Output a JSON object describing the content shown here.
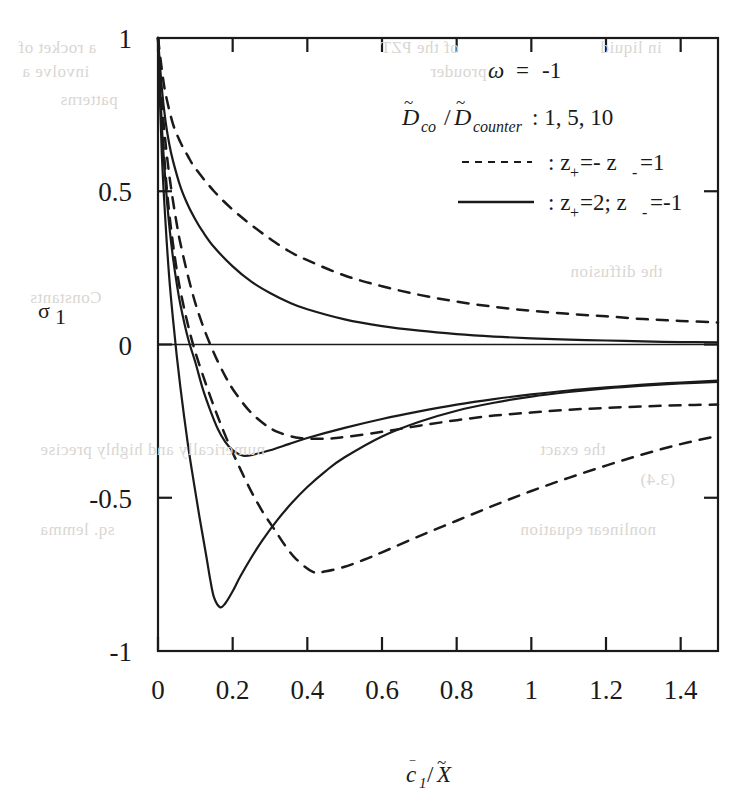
{
  "figure": {
    "background_color": "#ffffff",
    "ink_color": "#1a1a1a"
  },
  "axes": {
    "xlabel": "c̅1/X̃",
    "ylabel": "σ1",
    "x_ticks": [
      "0",
      "0.2",
      "0.4",
      "0.6",
      "0.8",
      "1",
      "1.2",
      "1.4"
    ],
    "y_ticks": [
      "1",
      "0.5",
      "0",
      "-0.5",
      "-1"
    ],
    "xlim": [
      0,
      1.5
    ],
    "ylim": [
      -1,
      1
    ]
  },
  "legend": {
    "omega_line": "ω = -1",
    "ratio_label_d": "D",
    "ratio_label_co": "co",
    "ratio_slash": "/",
    "ratio_label_d2": "D",
    "ratio_label_counter": "counter",
    "ratio_values": ": 1, 5, 10",
    "dashed_entry": ": z+ =- z- =1",
    "solid_entry": ": z+ =2; z- =-1",
    "dashed_z_base": ": z",
    "dashed_z_plus": "+",
    "dashed_z_mid": " =- z",
    "dashed_z_minus": "-",
    "dashed_z_tail": " =1",
    "solid_z_base": ": z",
    "solid_z_plus": "+",
    "solid_z_mid": " =2; z",
    "solid_z_minus": "-",
    "solid_z_tail": " =-1"
  },
  "bleed_through": [
    {
      "text": "a rocket of",
      "x": 18,
      "y": 38
    },
    {
      "text": "of the PZT",
      "x": 380,
      "y": 38
    },
    {
      "text": "in liquid",
      "x": 600,
      "y": 38
    },
    {
      "text": "involve a",
      "x": 22,
      "y": 62
    },
    {
      "text": "prouder",
      "x": 430,
      "y": 62
    },
    {
      "text": "patterns",
      "x": 60,
      "y": 90
    },
    {
      "text": "numerically and highly precise",
      "x": 40,
      "y": 440
    },
    {
      "text": "the exact",
      "x": 540,
      "y": 440
    },
    {
      "text": "(3.4)",
      "x": 640,
      "y": 470
    },
    {
      "text": "Constants",
      "x": 30,
      "y": 288
    },
    {
      "text": "the diffusion",
      "x": 570,
      "y": 262
    },
    {
      "text": "sq. lemma",
      "x": 40,
      "y": 520
    },
    {
      "text": "nonlinear equation",
      "x": 520,
      "y": 520
    }
  ],
  "chart_data": {
    "type": "line",
    "title": "",
    "xlabel": "c̅1/X̃",
    "ylabel": "σ1",
    "xlim": [
      0,
      1.5
    ],
    "ylim": [
      -1,
      1
    ],
    "grid": false,
    "legend_position": "top-right",
    "annotations": [
      "ω = -1",
      "D̃co/D̃counter : 1, 5, 10"
    ],
    "series": [
      {
        "name": "z+=-z-=1, Dco/Dcounter = 10",
        "style": "dashed",
        "points": [
          [
            0.0,
            1.0
          ],
          [
            0.01,
            0.9
          ],
          [
            0.02,
            0.82
          ],
          [
            0.04,
            0.72
          ],
          [
            0.06,
            0.66
          ],
          [
            0.08,
            0.615
          ],
          [
            0.1,
            0.575
          ],
          [
            0.15,
            0.5
          ],
          [
            0.2,
            0.44
          ],
          [
            0.25,
            0.39
          ],
          [
            0.3,
            0.345
          ],
          [
            0.35,
            0.305
          ],
          [
            0.4,
            0.275
          ],
          [
            0.5,
            0.225
          ],
          [
            0.6,
            0.19
          ],
          [
            0.7,
            0.162
          ],
          [
            0.8,
            0.14
          ],
          [
            0.9,
            0.123
          ],
          [
            1.0,
            0.11
          ],
          [
            1.1,
            0.1
          ],
          [
            1.2,
            0.092
          ],
          [
            1.3,
            0.083
          ],
          [
            1.4,
            0.077
          ],
          [
            1.5,
            0.072
          ]
        ]
      },
      {
        "name": "z+=2;z-=-1, Dco/Dcounter = 10",
        "style": "solid",
        "points": [
          [
            0.0,
            1.0
          ],
          [
            0.01,
            0.84
          ],
          [
            0.02,
            0.73
          ],
          [
            0.03,
            0.655
          ],
          [
            0.04,
            0.6
          ],
          [
            0.06,
            0.515
          ],
          [
            0.08,
            0.455
          ],
          [
            0.1,
            0.408
          ],
          [
            0.12,
            0.368
          ],
          [
            0.15,
            0.318
          ],
          [
            0.2,
            0.255
          ],
          [
            0.25,
            0.205
          ],
          [
            0.3,
            0.168
          ],
          [
            0.35,
            0.138
          ],
          [
            0.4,
            0.115
          ],
          [
            0.5,
            0.082
          ],
          [
            0.6,
            0.06
          ],
          [
            0.7,
            0.045
          ],
          [
            0.8,
            0.034
          ],
          [
            0.9,
            0.026
          ],
          [
            1.0,
            0.02
          ],
          [
            1.1,
            0.016
          ],
          [
            1.2,
            0.013
          ],
          [
            1.3,
            0.01
          ],
          [
            1.4,
            0.008
          ],
          [
            1.5,
            0.007
          ]
        ]
      },
      {
        "name": "z+=-z-=1, Dco/Dcounter = 5",
        "style": "dashed",
        "points": [
          [
            0.0,
            1.0
          ],
          [
            0.01,
            0.8
          ],
          [
            0.02,
            0.66
          ],
          [
            0.03,
            0.555
          ],
          [
            0.04,
            0.47
          ],
          [
            0.05,
            0.395
          ],
          [
            0.06,
            0.33
          ],
          [
            0.08,
            0.225
          ],
          [
            0.1,
            0.135
          ],
          [
            0.12,
            0.062
          ],
          [
            0.14,
            0.0
          ],
          [
            0.16,
            -0.055
          ],
          [
            0.18,
            -0.103
          ],
          [
            0.2,
            -0.145
          ],
          [
            0.24,
            -0.21
          ],
          [
            0.28,
            -0.255
          ],
          [
            0.32,
            -0.285
          ],
          [
            0.38,
            -0.305
          ],
          [
            0.45,
            -0.307
          ],
          [
            0.5,
            -0.302
          ],
          [
            0.6,
            -0.285
          ],
          [
            0.7,
            -0.265
          ],
          [
            0.8,
            -0.247
          ],
          [
            0.9,
            -0.232
          ],
          [
            1.0,
            -0.222
          ],
          [
            1.1,
            -0.213
          ],
          [
            1.2,
            -0.207
          ],
          [
            1.3,
            -0.202
          ],
          [
            1.4,
            -0.198
          ],
          [
            1.5,
            -0.196
          ]
        ]
      },
      {
        "name": "z+=2;z-=-1, Dco/Dcounter = 5",
        "style": "solid",
        "points": [
          [
            0.0,
            1.0
          ],
          [
            0.01,
            0.72
          ],
          [
            0.02,
            0.53
          ],
          [
            0.03,
            0.39
          ],
          [
            0.04,
            0.285
          ],
          [
            0.05,
            0.2
          ],
          [
            0.06,
            0.13
          ],
          [
            0.08,
            0.022
          ],
          [
            0.1,
            -0.058
          ],
          [
            0.12,
            -0.145
          ],
          [
            0.14,
            -0.215
          ],
          [
            0.16,
            -0.275
          ],
          [
            0.18,
            -0.318
          ],
          [
            0.2,
            -0.345
          ],
          [
            0.228,
            -0.363
          ],
          [
            0.26,
            -0.358
          ],
          [
            0.3,
            -0.345
          ],
          [
            0.35,
            -0.325
          ],
          [
            0.4,
            -0.305
          ],
          [
            0.5,
            -0.272
          ],
          [
            0.6,
            -0.243
          ],
          [
            0.7,
            -0.218
          ],
          [
            0.8,
            -0.196
          ],
          [
            0.9,
            -0.178
          ],
          [
            1.0,
            -0.163
          ],
          [
            1.1,
            -0.15
          ],
          [
            1.2,
            -0.14
          ],
          [
            1.3,
            -0.131
          ],
          [
            1.4,
            -0.124
          ],
          [
            1.5,
            -0.118
          ]
        ]
      },
      {
        "name": "z+=-z-=1, Dco/Dcounter = 1",
        "style": "dashed",
        "points": [
          [
            0.0,
            1.0
          ],
          [
            0.01,
            0.74
          ],
          [
            0.02,
            0.56
          ],
          [
            0.03,
            0.43
          ],
          [
            0.04,
            0.33
          ],
          [
            0.05,
            0.245
          ],
          [
            0.06,
            0.175
          ],
          [
            0.08,
            0.065
          ],
          [
            0.1,
            -0.025
          ],
          [
            0.13,
            -0.135
          ],
          [
            0.16,
            -0.235
          ],
          [
            0.19,
            -0.325
          ],
          [
            0.22,
            -0.405
          ],
          [
            0.25,
            -0.48
          ],
          [
            0.28,
            -0.545
          ],
          [
            0.31,
            -0.6
          ],
          [
            0.34,
            -0.655
          ],
          [
            0.37,
            -0.7
          ],
          [
            0.415,
            -0.742
          ],
          [
            0.45,
            -0.74
          ],
          [
            0.5,
            -0.725
          ],
          [
            0.55,
            -0.703
          ],
          [
            0.6,
            -0.678
          ],
          [
            0.7,
            -0.625
          ],
          [
            0.8,
            -0.575
          ],
          [
            0.9,
            -0.525
          ],
          [
            1.0,
            -0.478
          ],
          [
            1.1,
            -0.435
          ],
          [
            1.2,
            -0.395
          ],
          [
            1.3,
            -0.358
          ],
          [
            1.4,
            -0.325
          ],
          [
            1.5,
            -0.298
          ]
        ]
      },
      {
        "name": "z+=2;z-=-1, Dco/Dcounter = 1",
        "style": "solid",
        "points": [
          [
            0.0,
            1.0
          ],
          [
            0.01,
            0.63
          ],
          [
            0.02,
            0.4
          ],
          [
            0.03,
            0.22
          ],
          [
            0.04,
            0.085
          ],
          [
            0.05,
            -0.035
          ],
          [
            0.06,
            -0.14
          ],
          [
            0.07,
            -0.235
          ],
          [
            0.08,
            -0.325
          ],
          [
            0.09,
            -0.405
          ],
          [
            0.1,
            -0.48
          ],
          [
            0.11,
            -0.555
          ],
          [
            0.12,
            -0.625
          ],
          [
            0.13,
            -0.695
          ],
          [
            0.14,
            -0.768
          ],
          [
            0.15,
            -0.825
          ],
          [
            0.166,
            -0.857
          ],
          [
            0.18,
            -0.845
          ],
          [
            0.2,
            -0.805
          ],
          [
            0.22,
            -0.758
          ],
          [
            0.25,
            -0.695
          ],
          [
            0.28,
            -0.638
          ],
          [
            0.32,
            -0.572
          ],
          [
            0.36,
            -0.515
          ],
          [
            0.4,
            -0.465
          ],
          [
            0.45,
            -0.412
          ],
          [
            0.5,
            -0.368
          ],
          [
            0.6,
            -0.3
          ],
          [
            0.7,
            -0.252
          ],
          [
            0.8,
            -0.216
          ],
          [
            0.9,
            -0.19
          ],
          [
            1.0,
            -0.17
          ],
          [
            1.1,
            -0.155
          ],
          [
            1.2,
            -0.143
          ],
          [
            1.3,
            -0.134
          ],
          [
            1.4,
            -0.127
          ],
          [
            1.5,
            -0.122
          ]
        ]
      }
    ]
  }
}
